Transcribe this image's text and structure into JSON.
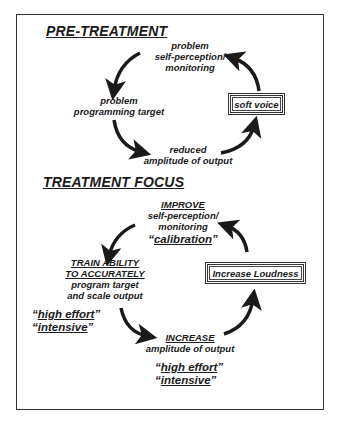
{
  "pre_treatment": {
    "heading": "PRE-TREATMENT",
    "top_label": [
      "problem",
      "self-perception/",
      "monitoring"
    ],
    "left_label": [
      "problem",
      "programming target"
    ],
    "bottom_label": [
      "reduced",
      "amplitude of output"
    ],
    "box_label": "soft voice"
  },
  "treatment_focus": {
    "heading": "TREATMENT FOCUS",
    "top_label": {
      "title": "IMPROVE",
      "lines": [
        "self-perception/",
        "monitoring"
      ],
      "quote": "calibration"
    },
    "left_label": {
      "title_lines": [
        "TRAIN ABILITY",
        "TO ACCURATELY"
      ],
      "lines": [
        "program target",
        "and scale output"
      ]
    },
    "left_quotes": [
      "high effort",
      "intensive"
    ],
    "bottom_label": {
      "title": "INCREASE",
      "lines": [
        "amplitude of output"
      ]
    },
    "bottom_quotes": [
      "high effort",
      "intensive"
    ],
    "box_label": "Increase Loudness"
  },
  "icons": {
    "arrow": "curved-arrow-icon"
  },
  "colors": {
    "ink": "#1a1a1a",
    "border": "#333333",
    "background": "#ffffff"
  }
}
